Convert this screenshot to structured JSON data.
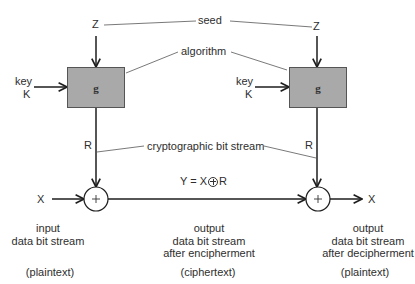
{
  "diagram": {
    "type": "stream-cipher-block-diagram",
    "colors": {
      "line": "#1e1e1e",
      "leader_line": "#6a6a6a",
      "box_fill": "#a9a9a9",
      "box_border": "#555555",
      "text": "#2e2e2e",
      "background": "#ffffff"
    },
    "labels": {
      "seed": "seed",
      "algorithm": "algorithm",
      "cryptographic_bit_stream": "cryptographic bit stream",
      "equation_left": "Y = X",
      "equation_right": "R"
    },
    "encipher": {
      "seed_input": "Z",
      "key_label": "key",
      "key_symbol": "K",
      "generator_label": "g",
      "stream_label": "R",
      "data_input": "X",
      "xor_symbol": "+",
      "input_caption": [
        "input",
        "data bit stream"
      ],
      "input_type": "(plaintext)"
    },
    "channel": {
      "caption": [
        "output",
        "data bit stream",
        "after encipherment"
      ],
      "type": "(ciphertext)"
    },
    "decipher": {
      "seed_input": "Z",
      "key_label": "key",
      "key_symbol": "K",
      "generator_label": "g",
      "stream_label": "R",
      "xor_symbol": "+",
      "data_output": "X",
      "output_caption": [
        "output",
        "data bit stream",
        "after decipherment"
      ],
      "output_type": "(plaintext)"
    }
  }
}
